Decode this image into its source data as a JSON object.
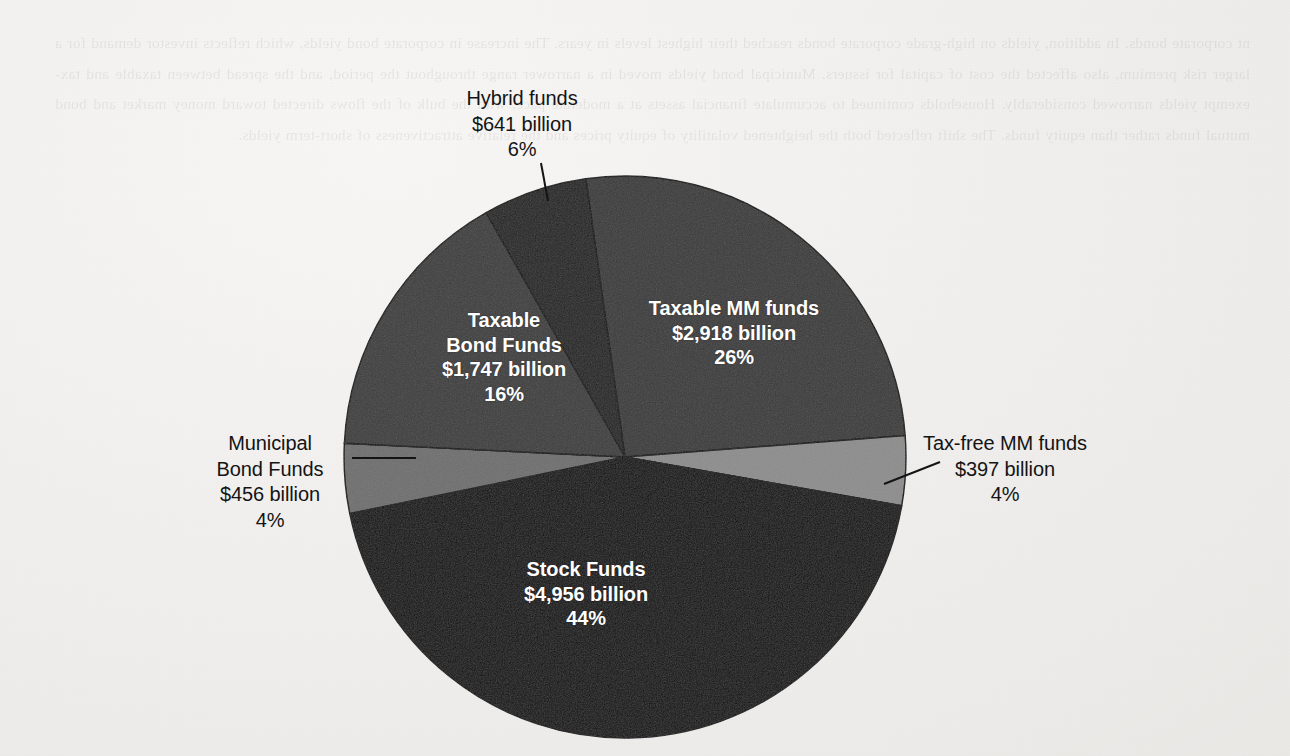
{
  "page": {
    "background_color": "#f1f0ed",
    "ghost_text": "nt corporate bonds. In addition, yields on high-grade corporate bonds reached their highest levels in years. The increase in corporate bond yields, which reflects investor demand for a larger risk premium, also affected the cost of capital for issuers. Municipal bond yields moved in a narrower range throughout the period, and the spread between taxable and tax-exempt yields narrowed considerably. Households continued to accumulate financial assets at a moderate pace, with the bulk of the flows directed toward money market and bond mutual funds rather than equity funds. The shift reflected both the heightened volatility of equity prices and the relative attractiveness of short-term yields."
  },
  "chart_data": {
    "type": "pie",
    "title": "",
    "total_label": "",
    "unit": "billion",
    "legend": "none",
    "center": {
      "x": 625,
      "y": 457
    },
    "radius": 281,
    "start_angle_deg": -98,
    "slices": [
      {
        "name": "Taxable MM funds",
        "label_line1": "Taxable MM funds",
        "label_line2": "$2,918 billion",
        "label_line3": "26%",
        "value": 2918,
        "percent": 26,
        "color": "#3a3a3a",
        "label_position": "inside",
        "text_color": "#ffffff"
      },
      {
        "name": "Tax-free MM funds",
        "label_line1": "Tax-free MM funds",
        "label_line2": "$397 billion",
        "label_line3": "4%",
        "value": 397,
        "percent": 4,
        "color": "#8d8d8d",
        "label_position": "outside-right",
        "text_color": "#141414"
      },
      {
        "name": "Stock Funds",
        "label_line1": "Stock Funds",
        "label_line2": "$4,956 billion",
        "label_line3": "44%",
        "value": 4956,
        "percent": 44,
        "color": "#0d0d0d",
        "label_position": "inside",
        "text_color": "#ffffff"
      },
      {
        "name": "Municipal Bond Funds",
        "label_line1": "Municipal",
        "label_line2": "Bond Funds",
        "label_line3": "$456 billion",
        "label_line4": "4%",
        "value": 456,
        "percent": 4,
        "color": "#6f6f6f",
        "label_position": "outside-left",
        "text_color": "#141414"
      },
      {
        "name": "Taxable Bond Funds",
        "label_line1": "Taxable",
        "label_line2": "Bond Funds",
        "label_line3": "$1,747 billion",
        "label_line4": "16%",
        "value": 1747,
        "percent": 16,
        "color": "#3d3d3d",
        "label_position": "inside",
        "text_color": "#ffffff"
      },
      {
        "name": "Hybrid funds",
        "label_line1": "Hybrid funds",
        "label_line2": "$641 billion",
        "label_line3": "6%",
        "value": 641,
        "percent": 6,
        "color": "#222222",
        "label_position": "outside-top",
        "text_color": "#141414"
      }
    ],
    "categories": [
      "Taxable MM funds",
      "Tax-free MM funds",
      "Stock Funds",
      "Municipal Bond Funds",
      "Taxable Bond Funds",
      "Hybrid funds"
    ],
    "values": [
      2918,
      397,
      4956,
      456,
      1747,
      641
    ],
    "percents": [
      26,
      4,
      44,
      4,
      16,
      6
    ]
  }
}
